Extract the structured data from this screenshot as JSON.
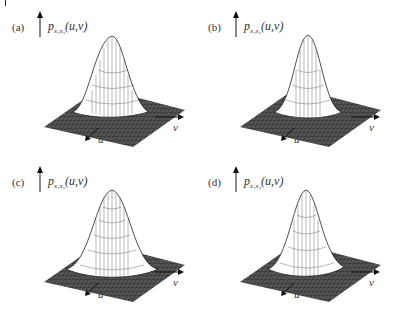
{
  "figure": {
    "panels": [
      {
        "id": "a",
        "label": "(a)",
        "z_label": "p",
        "z_sub": "x₁x₂",
        "z_args": "(u,v)",
        "x_label": "v",
        "y_label": "u",
        "shape": "skewed-peak-left"
      },
      {
        "id": "b",
        "label": "(b)",
        "z_label": "p",
        "z_sub": "x₁x₂",
        "z_args": "(u,v)",
        "x_label": "v",
        "y_label": "u",
        "shape": "narrow-peak"
      },
      {
        "id": "c",
        "label": "(c)",
        "z_label": "p",
        "z_sub": "x₁x₂",
        "z_args": "(u,v)",
        "x_label": "v",
        "y_label": "u",
        "shape": "wide-peak"
      },
      {
        "id": "d",
        "label": "(d)",
        "z_label": "p",
        "z_sub": "x₁x₂",
        "z_args": "(u,v)",
        "x_label": "v",
        "y_label": "u",
        "shape": "skewed-peak"
      }
    ]
  },
  "colors": {
    "plane": "#4a4a4a",
    "mesh": "#222222",
    "surface": "#ffffff"
  }
}
